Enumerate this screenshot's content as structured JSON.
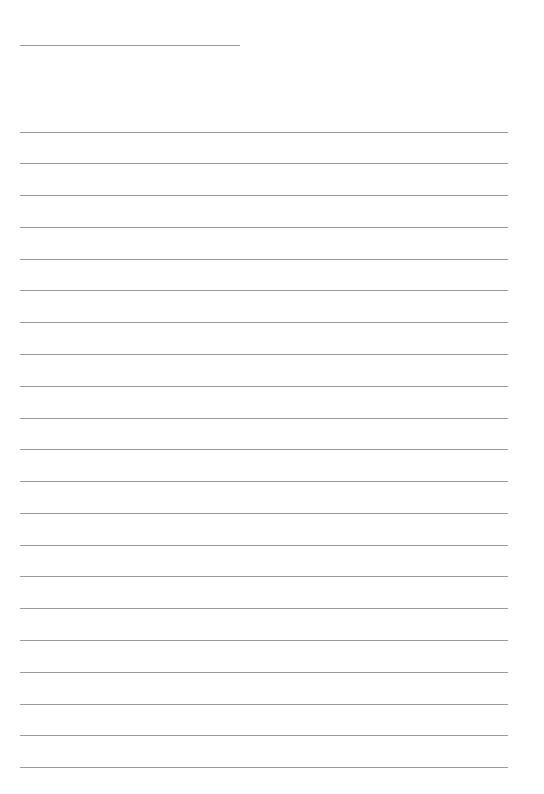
{
  "page": {
    "background": "#ffffff",
    "rule_color": "#9a9a9a",
    "header_rule": {
      "x1": 20,
      "x2": 240,
      "y": 45
    },
    "body_rules": {
      "x1": 20,
      "x2": 508,
      "y_start": 131.5,
      "spacing": 31.78,
      "count": 21
    }
  }
}
